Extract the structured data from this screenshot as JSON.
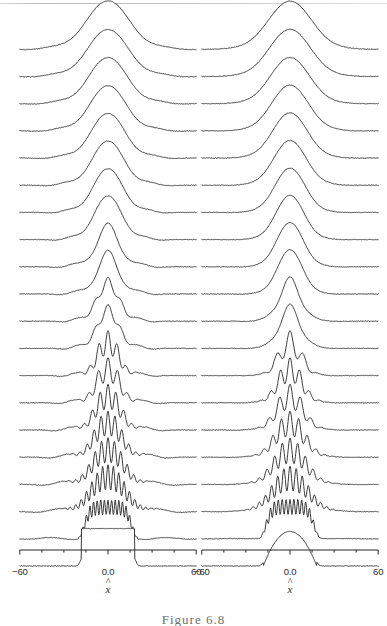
{
  "figure": {
    "caption": "Figure 6.8",
    "background_color": "#ffffff",
    "line_color": "#262626"
  },
  "axis": {
    "label": "x",
    "label_accent": "^",
    "tick_labels": [
      "−60",
      "0.0",
      "60"
    ],
    "tick_values": [
      -60,
      0,
      60
    ],
    "range": [
      -60,
      60
    ],
    "minor_ticks": [
      -45,
      -30,
      -15,
      15,
      30,
      45
    ]
  },
  "panels": [
    {
      "id": "left",
      "name": "rectangular-initial-state",
      "trace_count": 20
    },
    {
      "id": "right",
      "name": "parabolic-initial-state",
      "trace_count": 20
    }
  ],
  "chart_data": {
    "type": "line",
    "title": "",
    "subtitle": "",
    "xlabel": "x̂",
    "ylabel": "",
    "xlim": [
      -60,
      60
    ],
    "ylim": [
      0,
      1
    ],
    "grid": false,
    "legend": null,
    "style": "waterfall / offset stacked traces, bottom = initial state, top = final state",
    "n_panels": 2,
    "traces_per_panel": 20,
    "x": [
      -60,
      -58,
      -56,
      -54,
      -52,
      -50,
      -48,
      -46,
      -44,
      -42,
      -40,
      -38,
      -36,
      -34,
      -32,
      -30,
      -28,
      -26,
      -24,
      -22,
      -20,
      -18,
      -16,
      -14,
      -12,
      -10,
      -8,
      -6,
      -4,
      -2,
      0,
      2,
      4,
      6,
      8,
      10,
      12,
      14,
      16,
      18,
      20,
      22,
      24,
      26,
      28,
      30,
      32,
      34,
      36,
      38,
      40,
      42,
      44,
      46,
      48,
      50,
      52,
      54,
      56,
      58,
      60
    ],
    "panels": [
      {
        "name": "left-panel",
        "initial_profile": "rectangle (top-hat), half-width ≈ 18",
        "final_profile": "smooth single broad peak with small side undulations",
        "series": [
          {
            "name": "trace-20-top",
            "index": 20,
            "shape": "gaussian",
            "width": 16.0,
            "amplitude": 1.0,
            "ripple_lobes": 0,
            "side_wiggle": 0.03
          },
          {
            "name": "trace-19",
            "index": 19,
            "shape": "gaussian",
            "width": 15.2,
            "amplitude": 0.97,
            "ripple_lobes": 0,
            "side_wiggle": 0.032
          },
          {
            "name": "trace-18",
            "index": 18,
            "shape": "gaussian",
            "width": 14.4,
            "amplitude": 0.95,
            "ripple_lobes": 0,
            "side_wiggle": 0.034
          },
          {
            "name": "trace-17",
            "index": 17,
            "shape": "gaussian",
            "width": 13.6,
            "amplitude": 0.93,
            "ripple_lobes": 0,
            "side_wiggle": 0.036
          },
          {
            "name": "trace-16",
            "index": 16,
            "shape": "gaussian",
            "width": 12.8,
            "amplitude": 0.92,
            "ripple_lobes": 0,
            "side_wiggle": 0.038
          },
          {
            "name": "trace-15",
            "index": 15,
            "shape": "gaussian",
            "width": 12.0,
            "amplitude": 0.91,
            "ripple_lobes": 0,
            "side_wiggle": 0.04
          },
          {
            "name": "trace-14",
            "index": 14,
            "shape": "gaussian",
            "width": 11.2,
            "amplitude": 0.9,
            "ripple_lobes": 0,
            "side_wiggle": 0.042
          },
          {
            "name": "trace-13",
            "index": 13,
            "shape": "gaussian",
            "width": 10.4,
            "amplitude": 0.9,
            "ripple_lobes": 0,
            "side_wiggle": 0.044
          },
          {
            "name": "trace-12",
            "index": 12,
            "shape": "gaussian-ripple",
            "width": 9.8,
            "amplitude": 0.9,
            "ripple_lobes": 1,
            "side_wiggle": 0.046
          },
          {
            "name": "trace-11",
            "index": 11,
            "shape": "gaussian-ripple",
            "width": 9.2,
            "amplitude": 0.9,
            "ripple_lobes": 1,
            "side_wiggle": 0.048
          },
          {
            "name": "trace-10",
            "index": 10,
            "shape": "gaussian-ripple",
            "width": 8.8,
            "amplitude": 0.9,
            "ripple_lobes": 2,
            "side_wiggle": 0.05
          },
          {
            "name": "trace-9",
            "index": 9,
            "shape": "gaussian-ripple",
            "width": 8.6,
            "amplitude": 0.9,
            "ripple_lobes": 2,
            "side_wiggle": 0.052
          },
          {
            "name": "trace-8",
            "index": 8,
            "shape": "multi-lobe",
            "width": 9.0,
            "amplitude": 0.92,
            "ripple_lobes": 3,
            "side_wiggle": 0.054
          },
          {
            "name": "trace-7",
            "index": 7,
            "shape": "multi-lobe",
            "width": 9.6,
            "amplitude": 0.93,
            "ripple_lobes": 3,
            "side_wiggle": 0.056
          },
          {
            "name": "trace-6",
            "index": 6,
            "shape": "multi-lobe",
            "width": 10.4,
            "amplitude": 0.94,
            "ripple_lobes": 4,
            "side_wiggle": 0.058
          },
          {
            "name": "trace-5",
            "index": 5,
            "shape": "multi-lobe",
            "width": 11.4,
            "amplitude": 0.95,
            "ripple_lobes": 5,
            "side_wiggle": 0.06
          },
          {
            "name": "trace-4",
            "index": 4,
            "shape": "multi-lobe",
            "width": 12.6,
            "amplitude": 0.96,
            "ripple_lobes": 6,
            "side_wiggle": 0.06
          },
          {
            "name": "trace-3",
            "index": 3,
            "shape": "multi-lobe",
            "width": 14.0,
            "amplitude": 0.97,
            "ripple_lobes": 8,
            "side_wiggle": 0.055
          },
          {
            "name": "trace-2",
            "index": 2,
            "shape": "fine-oscillation",
            "width": 16.0,
            "amplitude": 0.8,
            "ripple_lobes": 13,
            "side_wiggle": 0.03
          },
          {
            "name": "trace-1-bottom",
            "index": 1,
            "shape": "rectangle",
            "width": 18.0,
            "amplitude": 0.78,
            "ripple_lobes": 0,
            "side_wiggle": 0.0
          }
        ]
      },
      {
        "name": "right-panel",
        "initial_profile": "smooth dome / parabola, half-width ≈ 18",
        "final_profile": "smooth single broad peak, flat wings",
        "series": [
          {
            "name": "trace-20-top",
            "index": 20,
            "shape": "gaussian",
            "width": 16.0,
            "amplitude": 1.0,
            "ripple_lobes": 0,
            "side_wiggle": 0.006
          },
          {
            "name": "trace-19",
            "index": 19,
            "shape": "gaussian",
            "width": 15.2,
            "amplitude": 0.98,
            "ripple_lobes": 0,
            "side_wiggle": 0.006
          },
          {
            "name": "trace-18",
            "index": 18,
            "shape": "gaussian",
            "width": 14.4,
            "amplitude": 0.96,
            "ripple_lobes": 0,
            "side_wiggle": 0.006
          },
          {
            "name": "trace-17",
            "index": 17,
            "shape": "gaussian",
            "width": 13.6,
            "amplitude": 0.95,
            "ripple_lobes": 0,
            "side_wiggle": 0.007
          },
          {
            "name": "trace-16",
            "index": 16,
            "shape": "gaussian",
            "width": 12.8,
            "amplitude": 0.94,
            "ripple_lobes": 0,
            "side_wiggle": 0.007
          },
          {
            "name": "trace-15",
            "index": 15,
            "shape": "gaussian",
            "width": 12.0,
            "amplitude": 0.93,
            "ripple_lobes": 0,
            "side_wiggle": 0.008
          },
          {
            "name": "trace-14",
            "index": 14,
            "shape": "gaussian",
            "width": 11.2,
            "amplitude": 0.92,
            "ripple_lobes": 0,
            "side_wiggle": 0.008
          },
          {
            "name": "trace-13",
            "index": 13,
            "shape": "gaussian",
            "width": 10.4,
            "amplitude": 0.92,
            "ripple_lobes": 0,
            "side_wiggle": 0.009
          },
          {
            "name": "trace-12",
            "index": 12,
            "shape": "gaussian",
            "width": 9.8,
            "amplitude": 0.92,
            "ripple_lobes": 0,
            "side_wiggle": 0.009
          },
          {
            "name": "trace-11",
            "index": 11,
            "shape": "gaussian",
            "width": 9.2,
            "amplitude": 0.92,
            "ripple_lobes": 0,
            "side_wiggle": 0.01
          },
          {
            "name": "trace-10",
            "index": 10,
            "shape": "gaussian-ripple",
            "width": 8.8,
            "amplitude": 0.92,
            "ripple_lobes": 1,
            "side_wiggle": 0.01
          },
          {
            "name": "trace-9",
            "index": 9,
            "shape": "gaussian-ripple",
            "width": 8.6,
            "amplitude": 0.92,
            "ripple_lobes": 1,
            "side_wiggle": 0.011
          },
          {
            "name": "trace-8",
            "index": 8,
            "shape": "multi-lobe",
            "width": 9.0,
            "amplitude": 0.93,
            "ripple_lobes": 2,
            "side_wiggle": 0.011
          },
          {
            "name": "trace-7",
            "index": 7,
            "shape": "multi-lobe",
            "width": 9.6,
            "amplitude": 0.94,
            "ripple_lobes": 3,
            "side_wiggle": 0.012
          },
          {
            "name": "trace-6",
            "index": 6,
            "shape": "multi-lobe",
            "width": 10.4,
            "amplitude": 0.95,
            "ripple_lobes": 3,
            "side_wiggle": 0.012
          },
          {
            "name": "trace-5",
            "index": 5,
            "shape": "multi-lobe",
            "width": 11.4,
            "amplitude": 0.96,
            "ripple_lobes": 4,
            "side_wiggle": 0.012
          },
          {
            "name": "trace-4",
            "index": 4,
            "shape": "multi-lobe",
            "width": 12.6,
            "amplitude": 0.96,
            "ripple_lobes": 5,
            "side_wiggle": 0.012
          },
          {
            "name": "trace-3",
            "index": 3,
            "shape": "multi-lobe",
            "width": 14.0,
            "amplitude": 0.95,
            "ripple_lobes": 7,
            "side_wiggle": 0.01
          },
          {
            "name": "trace-2",
            "index": 2,
            "shape": "fine-oscillation",
            "width": 16.0,
            "amplitude": 0.82,
            "ripple_lobes": 12,
            "side_wiggle": 0.006
          },
          {
            "name": "trace-1-bottom",
            "index": 1,
            "shape": "parabola",
            "width": 18.0,
            "amplitude": 0.72,
            "ripple_lobes": 0,
            "side_wiggle": 0.0
          }
        ]
      }
    ]
  }
}
